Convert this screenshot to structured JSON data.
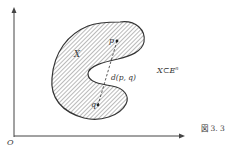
{
  "figure": {
    "caption": "図 3. 3",
    "origin_label": "O",
    "set_label": "X",
    "point_p_label": "p",
    "point_q_label": "q",
    "distance_label": "d(p, q)",
    "relation_label_main": "X⊂E",
    "relation_label_sup": "n",
    "colors": {
      "ink": "#333333",
      "hatch": "#555555",
      "background": "#ffffff"
    }
  }
}
